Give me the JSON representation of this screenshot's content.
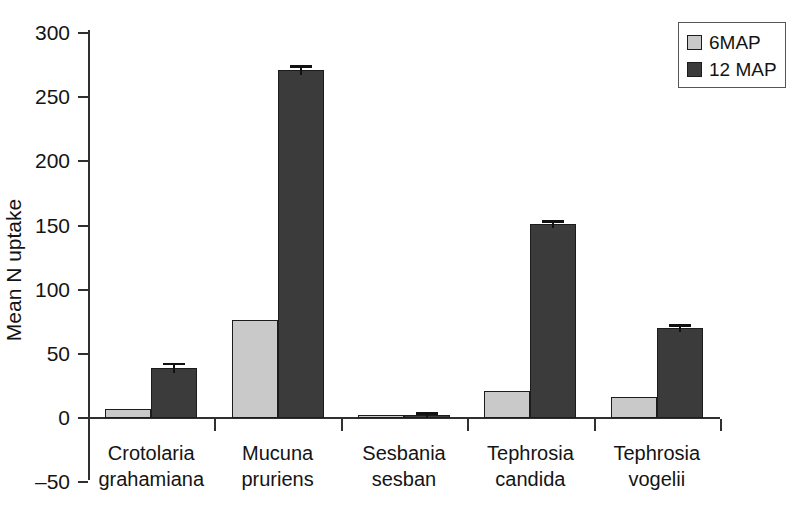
{
  "chart_data": {
    "type": "bar",
    "title": "",
    "xlabel": "",
    "ylabel": "Mean N uptake",
    "ylim": [
      -50,
      300
    ],
    "yticks": [
      -50,
      0,
      50,
      100,
      150,
      200,
      250,
      300
    ],
    "ytick_labels": [
      "–50",
      "0",
      "50",
      "100",
      "150",
      "200",
      "250",
      "300"
    ],
    "grid": false,
    "legend_position": "top-right",
    "categories": [
      "Crotolaria grahamiana",
      "Mucuna pruriens",
      "Sesbania sesban",
      "Tephrosia candida",
      "Tephrosia vogelii"
    ],
    "category_lines": [
      [
        "Crotolaria",
        "grahamiana"
      ],
      [
        "Mucuna",
        "pruriens"
      ],
      [
        "Sesbania",
        "sesban"
      ],
      [
        "Tephrosia",
        "candida"
      ],
      [
        "Tephrosia",
        "vogelii"
      ]
    ],
    "series": [
      {
        "name": "6MAP",
        "color": "#c9c9c9",
        "values": [
          7,
          76,
          1,
          21,
          16
        ],
        "errors": [
          0,
          0,
          0,
          0,
          0
        ]
      },
      {
        "name": "12 MAP",
        "color": "#3b3b3b",
        "values": [
          39,
          271,
          1,
          151,
          70
        ],
        "errors": [
          4,
          4,
          2,
          3,
          3
        ]
      }
    ]
  },
  "legend": {
    "entries": [
      {
        "label": "6MAP",
        "color": "#c9c9c9"
      },
      {
        "label": "12 MAP",
        "color": "#3b3b3b"
      }
    ]
  },
  "axis": {
    "y_title": "Mean N uptake"
  }
}
